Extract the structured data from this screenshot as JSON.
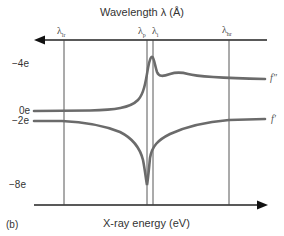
{
  "figure": {
    "panel_label": "(b)",
    "top_axis": {
      "title": "Wavelength λ (Å)",
      "direction": "right-to-left"
    },
    "bottom_axis": {
      "title": "X-ray energy (eV)",
      "direction": "left-to-right"
    },
    "wavelength_markers": [
      {
        "symbol": "λ",
        "sub": "lr"
      },
      {
        "symbol": "λ",
        "sub": "p"
      },
      {
        "symbol": "λ",
        "sub": "i"
      },
      {
        "symbol": "λ",
        "sub": "hr"
      }
    ],
    "y_ticks": [
      "−4e",
      "0e",
      "−2e",
      "−8e"
    ],
    "curves": [
      {
        "name": "f″",
        "color": "#6b6b6b"
      },
      {
        "name": "f′",
        "color": "#6b6b6b"
      }
    ],
    "colors": {
      "axis": "#222222",
      "curve": "#6b6b6b",
      "guide": "#444444"
    }
  }
}
